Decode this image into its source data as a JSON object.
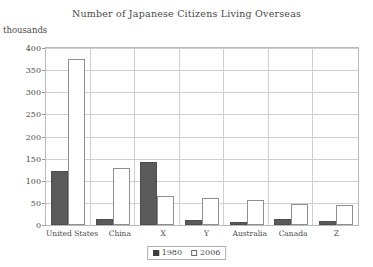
{
  "chart_data": {
    "type": "bar",
    "title": "Number of Japanese Citizens Living Overseas",
    "xlabel": "",
    "ylabel": "thousands",
    "ylim": [
      0,
      400
    ],
    "yticks": [
      0,
      50,
      100,
      150,
      200,
      250,
      300,
      350,
      400
    ],
    "grid": true,
    "legend_position": "bottom-center",
    "categories": [
      "United States",
      "China",
      "X",
      "Y",
      "Australia",
      "Canada",
      "Z"
    ],
    "series": [
      {
        "name": "1980",
        "color": "#5a5a5a",
        "values": [
          122,
          13,
          143,
          11,
          6,
          13,
          8
        ]
      },
      {
        "name": "2006",
        "color": "#ffffff",
        "values": [
          375,
          128,
          65,
          60,
          57,
          47,
          45
        ]
      }
    ]
  },
  "legend": {
    "items": [
      {
        "label": "1980",
        "swatch": "filled-square-icon"
      },
      {
        "label": "2006",
        "swatch": "open-square-icon"
      }
    ]
  },
  "colors": {
    "series_1980": "#5a5a5a",
    "series_2006": "#ffffff",
    "frame": "#b9b9b9",
    "grid": "#cfcfcf",
    "text": "#4a4a4a",
    "background": "#ffffff"
  }
}
